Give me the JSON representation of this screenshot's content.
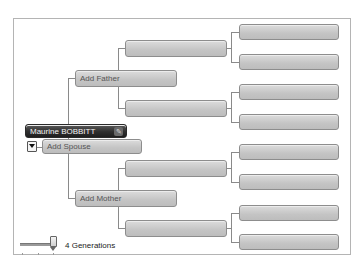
{
  "tree": {
    "root": {
      "name": "Maurine BOBBITT",
      "edit_icon": "edit-icon"
    },
    "spouse": {
      "label": "Add Spouse",
      "toggle_icon": "dropdown-arrow-icon"
    },
    "father": {
      "label": "Add Father"
    },
    "mother": {
      "label": "Add Mother"
    },
    "grandparents": [
      "",
      "",
      "",
      ""
    ],
    "great_grandparents": [
      "",
      "",
      "",
      "",
      "",
      "",
      "",
      ""
    ]
  },
  "generations": {
    "label": "4 Generations",
    "value": 4,
    "slider_icon": "slider-thumb-icon"
  }
}
